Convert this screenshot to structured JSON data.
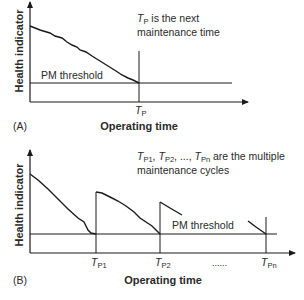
{
  "panel_a": {
    "tag": "(A)",
    "y_label": "Health indicator",
    "x_label": "Operating time",
    "threshold_label": "PM threshold",
    "note_line1_sym": "T",
    "note_line1_sub": "P",
    "note_line1_rest": " is the next",
    "note_line2": "maintenance time",
    "tick_sym": "T",
    "tick_sub": "P"
  },
  "panel_b": {
    "tag": "(B)",
    "y_label": "Health indicator",
    "x_label": "Operating time",
    "threshold_label": "PM threshold",
    "note_line1_rest": " are the multiple",
    "note_line2": "maintenance cycles",
    "ticks": [
      {
        "sym": "T",
        "sub": "P1"
      },
      {
        "sym": "T",
        "sub": "P2"
      },
      {
        "sym": "T",
        "sub": "Pn"
      }
    ],
    "ellipsis": "......",
    "note_sep": ", ",
    "note_dots": ", ..., "
  },
  "colors": {
    "line": "#1a1a1a",
    "text": "#2a2a2a"
  }
}
